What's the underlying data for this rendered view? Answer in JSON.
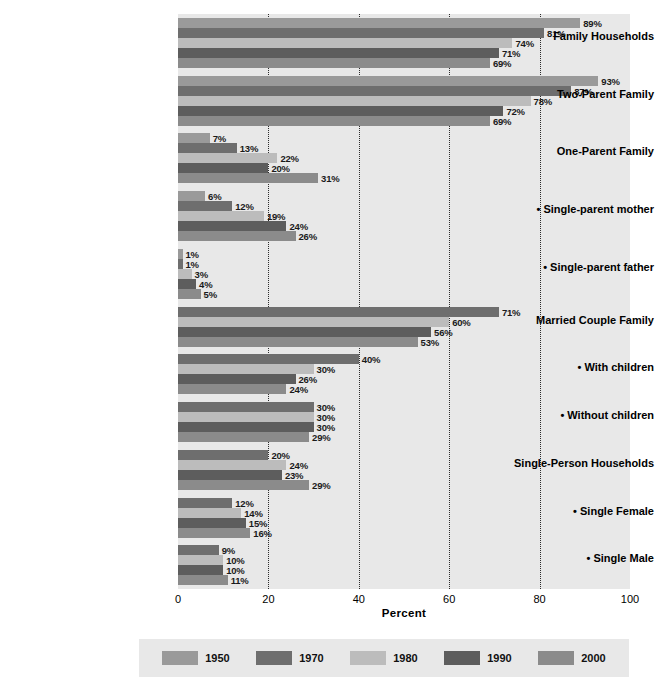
{
  "chart_data": {
    "type": "bar",
    "orientation": "horizontal",
    "title": "",
    "xlabel": "Percent",
    "ylabel": "",
    "xlim": [
      0,
      100
    ],
    "xticks": [
      0,
      20,
      40,
      60,
      80,
      100
    ],
    "gridlines": [
      20,
      40,
      60,
      80
    ],
    "grid": true,
    "legend_position": "bottom",
    "value_suffix": "%",
    "series": [
      {
        "name": "1950",
        "color": "#9a9a9a"
      },
      {
        "name": "1970",
        "color": "#6e6e6e"
      },
      {
        "name": "1980",
        "color": "#bcbcbc"
      },
      {
        "name": "1990",
        "color": "#5d5d5d"
      },
      {
        "name": "2000",
        "color": "#8b8b8b"
      }
    ],
    "categories": [
      {
        "label": "Family Households",
        "bullet": false,
        "points": [
          {
            "series": "1950",
            "value": 89,
            "label": "89%"
          },
          {
            "series": "1970",
            "value": 81,
            "label": "81%"
          },
          {
            "series": "1980",
            "value": 74,
            "label": "74%"
          },
          {
            "series": "1990",
            "value": 71,
            "label": "71%"
          },
          {
            "series": "2000",
            "value": 69,
            "label": "69%"
          }
        ]
      },
      {
        "label": "Two-Parent Family",
        "bullet": false,
        "points": [
          {
            "series": "1950",
            "value": 93,
            "label": "93%"
          },
          {
            "series": "1970",
            "value": 87,
            "label": "87%"
          },
          {
            "series": "1980",
            "value": 78,
            "label": "78%"
          },
          {
            "series": "1990",
            "value": 72,
            "label": "72%"
          },
          {
            "series": "2000",
            "value": 69,
            "label": "69%"
          }
        ]
      },
      {
        "label": "One-Parent Family",
        "bullet": false,
        "points": [
          {
            "series": "1950",
            "value": 7,
            "label": "7%"
          },
          {
            "series": "1970",
            "value": 13,
            "label": "13%"
          },
          {
            "series": "1980",
            "value": 22,
            "label": "22%"
          },
          {
            "series": "1990",
            "value": 20,
            "label": "20%"
          },
          {
            "series": "2000",
            "value": 31,
            "label": "31%"
          }
        ]
      },
      {
        "label": "• Single-parent mother",
        "bullet": true,
        "points": [
          {
            "series": "1950",
            "value": 6,
            "label": "6%"
          },
          {
            "series": "1970",
            "value": 12,
            "label": "12%"
          },
          {
            "series": "1980",
            "value": 19,
            "label": "19%"
          },
          {
            "series": "1990",
            "value": 24,
            "label": "24%"
          },
          {
            "series": "2000",
            "value": 26,
            "label": "26%"
          }
        ]
      },
      {
        "label": "• Single-parent father",
        "bullet": true,
        "points": [
          {
            "series": "1950",
            "value": 1,
            "label": "1%"
          },
          {
            "series": "1970",
            "value": 1,
            "label": "1%"
          },
          {
            "series": "1980",
            "value": 3,
            "label": "3%"
          },
          {
            "series": "1990",
            "value": 4,
            "label": "4%"
          },
          {
            "series": "2000",
            "value": 5,
            "label": "5%"
          }
        ]
      },
      {
        "label": "Married Couple Family",
        "bullet": false,
        "points": [
          {
            "series": "1970",
            "value": 71,
            "label": "71%"
          },
          {
            "series": "1980",
            "value": 60,
            "label": "60%"
          },
          {
            "series": "1990",
            "value": 56,
            "label": "56%"
          },
          {
            "series": "2000",
            "value": 53,
            "label": "53%"
          }
        ]
      },
      {
        "label": "• With children",
        "bullet": true,
        "points": [
          {
            "series": "1970",
            "value": 40,
            "label": "40%"
          },
          {
            "series": "1980",
            "value": 30,
            "label": "30%"
          },
          {
            "series": "1990",
            "value": 26,
            "label": "26%"
          },
          {
            "series": "2000",
            "value": 24,
            "label": "24%"
          }
        ]
      },
      {
        "label": "• Without children",
        "bullet": true,
        "points": [
          {
            "series": "1970",
            "value": 30,
            "label": "30%"
          },
          {
            "series": "1980",
            "value": 30,
            "label": "30%"
          },
          {
            "series": "1990",
            "value": 30,
            "label": "30%"
          },
          {
            "series": "2000",
            "value": 29,
            "label": "29%"
          }
        ]
      },
      {
        "label": "Single-Person Households",
        "bullet": false,
        "points": [
          {
            "series": "1970",
            "value": 20,
            "label": "20%"
          },
          {
            "series": "1980",
            "value": 24,
            "label": "24%"
          },
          {
            "series": "1990",
            "value": 23,
            "label": "23%"
          },
          {
            "series": "2000",
            "value": 29,
            "label": "29%"
          }
        ]
      },
      {
        "label": "• Single Female",
        "bullet": true,
        "points": [
          {
            "series": "1970",
            "value": 12,
            "label": "12%"
          },
          {
            "series": "1980",
            "value": 14,
            "label": "14%"
          },
          {
            "series": "1990",
            "value": 15,
            "label": "15%"
          },
          {
            "series": "2000",
            "value": 16,
            "label": "16%"
          }
        ]
      },
      {
        "label": "• Single Male",
        "bullet": true,
        "points": [
          {
            "series": "1970",
            "value": 9,
            "label": "9%"
          },
          {
            "series": "1980",
            "value": 10,
            "label": "10%"
          },
          {
            "series": "1990",
            "value": 10,
            "label": "10%"
          },
          {
            "series": "2000",
            "value": 11,
            "label": "11%"
          }
        ]
      }
    ]
  },
  "axis": {
    "x_title": "Percent",
    "x_tick_labels": [
      "0",
      "20",
      "40",
      "60",
      "80",
      "100"
    ]
  },
  "legend": {
    "entries": [
      {
        "label": "1950",
        "color": "#9a9a9a"
      },
      {
        "label": "1970",
        "color": "#6e6e6e"
      },
      {
        "label": "1980",
        "color": "#bcbcbc"
      },
      {
        "label": "1990",
        "color": "#5d5d5d"
      },
      {
        "label": "2000",
        "color": "#8b8b8b"
      }
    ]
  }
}
